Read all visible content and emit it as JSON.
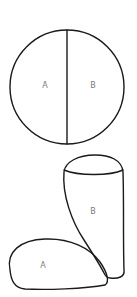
{
  "figure": {
    "top_diagram": {
      "description": "Circle divided into two equal halves by a vertical line",
      "labels": {
        "left": "A",
        "right": "B"
      }
    },
    "bottom_diagram": {
      "description": "Two blob regions: A (lower-left flattened loop) touching B (tall cup-shaped region)",
      "labels": {
        "tall_region": "B",
        "low_region": "A"
      }
    }
  },
  "colors": {
    "stroke": "#1a1a1a",
    "label": "#7a7a7a",
    "background": "#ffffff"
  }
}
